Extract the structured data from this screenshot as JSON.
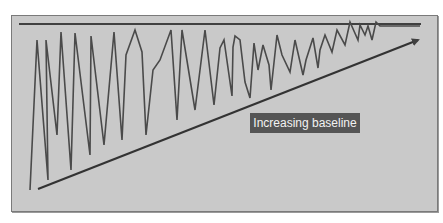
{
  "diagram": {
    "annotation_label": "Increasing baseline",
    "colors": {
      "background": "#ffffff",
      "panel": "#c9c9c9",
      "line": "#404040",
      "label_bg": "#555555",
      "label_text": "#f2f2f2"
    },
    "elements": {
      "ceiling_line": "horizontal ceiling line across top",
      "zigzag_series": "oscillating series with narrowing amplitude",
      "baseline_arrow": "rising baseline arrow from lower-left to upper-right"
    }
  }
}
